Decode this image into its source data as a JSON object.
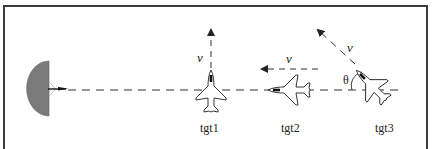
{
  "figure": {
    "colors": {
      "line": "#222222",
      "radar_fill": "#7a7a7a",
      "frame": "#3a3a3a"
    },
    "radar": {
      "label": ""
    },
    "targets": [
      {
        "id": "tgt1",
        "label": "tgt1",
        "velocity_label": "v",
        "heading": "up"
      },
      {
        "id": "tgt2",
        "label": "tgt2",
        "velocity_label": "v",
        "heading": "left"
      },
      {
        "id": "tgt3",
        "label": "tgt3",
        "velocity_label": "v",
        "heading": "up-left",
        "angle_label": "θ"
      }
    ]
  }
}
